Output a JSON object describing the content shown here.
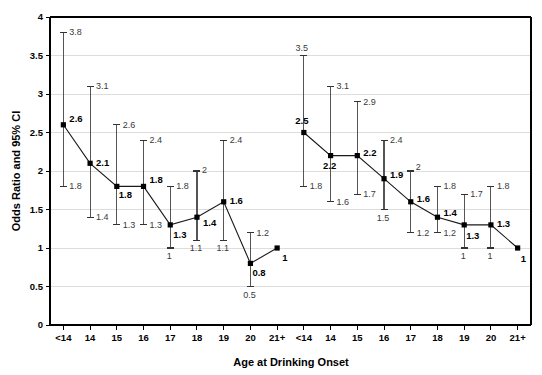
{
  "chart_data": {
    "type": "line",
    "title": "",
    "subtitle": "",
    "xlabel": "Age at Drinking Onset",
    "ylabel": "Odds Ratio and 95% CI",
    "ylim": [
      0,
      4
    ],
    "ytick_values": [
      0,
      0.5,
      1,
      1.5,
      2,
      2.5,
      3,
      3.5,
      4
    ],
    "ytick_labels": [
      "0",
      "0.5",
      "1",
      "1.5",
      "2",
      "2.5",
      "3",
      "3.5",
      "4"
    ],
    "grid": "horizontal",
    "legend": "none",
    "categories": [
      "<14",
      "14",
      "15",
      "16",
      "17",
      "18",
      "19",
      "20",
      "21+"
    ],
    "xtick_labels": [
      "<14",
      "14",
      "15",
      "16",
      "17",
      "18",
      "19",
      "20",
      "21+",
      "<14",
      "14",
      "15",
      "16",
      "17",
      "18",
      "19",
      "20",
      "21+"
    ],
    "series": [
      {
        "name": "Panel 1",
        "panel": 1,
        "values": [
          2.6,
          2.1,
          1.8,
          1.8,
          1.3,
          1.4,
          1.6,
          0.8,
          1
        ],
        "value_labels": [
          "2.6",
          "2.1",
          "1.8",
          "1.8",
          "1.3",
          "1.4",
          "1.6",
          "0.8",
          "1"
        ],
        "ci_upper": [
          3.8,
          3.1,
          2.6,
          2.4,
          1.8,
          2.0,
          2.4,
          1.2,
          null
        ],
        "ci_upper_labels": [
          "3.8",
          "3.1",
          "2.6",
          "2.4",
          "1.8",
          "2",
          "2.4",
          "1.2",
          ""
        ],
        "ci_lower": [
          1.8,
          1.4,
          1.3,
          1.3,
          1.0,
          1.1,
          1.1,
          0.5,
          null
        ],
        "ci_lower_labels": [
          "1.8",
          "1.4",
          "1.3",
          "1.3",
          "1",
          "1.1",
          "1.1",
          "0.5",
          ""
        ]
      },
      {
        "name": "Panel 2",
        "panel": 2,
        "values": [
          2.5,
          2.2,
          2.2,
          1.9,
          1.6,
          1.4,
          1.3,
          1.3,
          1
        ],
        "value_labels": [
          "2.5",
          "2.2",
          "2.2",
          "1.9",
          "1.6",
          "1.4",
          "1.3",
          "1.3",
          "1"
        ],
        "ci_upper": [
          3.5,
          3.1,
          2.9,
          2.4,
          2.0,
          1.8,
          1.7,
          1.8,
          null
        ],
        "ci_upper_labels": [
          "3.5",
          "3.1",
          "2.9",
          "2.4",
          "2",
          "1.8",
          "1.7",
          "1.8",
          ""
        ],
        "ci_lower": [
          1.8,
          1.6,
          1.7,
          1.5,
          1.2,
          1.2,
          1.0,
          1.0,
          null
        ],
        "ci_lower_labels": [
          "1.8",
          "1.6",
          "1.7",
          "1.5",
          "1.2",
          "1.2",
          "1",
          "1",
          ""
        ]
      }
    ]
  }
}
